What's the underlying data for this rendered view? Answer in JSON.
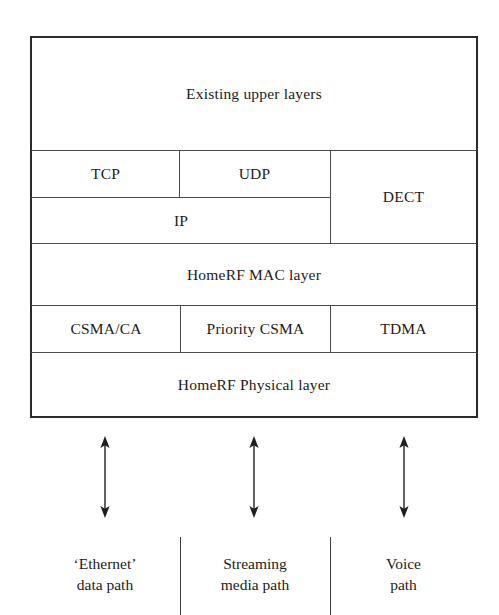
{
  "diagram": {
    "type": "layered-block-diagram",
    "ink_color": "#2b2b2b",
    "rule_color": "#4a4a4a",
    "background_color": "#ffffff"
  },
  "stack": {
    "rows": [
      {
        "id": "upper-layers",
        "cells": [
          {
            "id": "existing-upper-layers",
            "label": "Existing upper layers"
          }
        ]
      },
      {
        "id": "transport",
        "cells": [
          {
            "id": "tcp",
            "label": "TCP"
          },
          {
            "id": "udp",
            "label": "UDP"
          },
          {
            "id": "dect",
            "label": "DECT"
          }
        ]
      },
      {
        "id": "network",
        "cells": [
          {
            "id": "ip",
            "label": "IP"
          }
        ]
      },
      {
        "id": "mac",
        "cells": [
          {
            "id": "homerf-mac-layer",
            "label": "HomeRF MAC layer"
          }
        ]
      },
      {
        "id": "access-methods",
        "cells": [
          {
            "id": "csma-ca",
            "label": "CSMA/CA"
          },
          {
            "id": "priority-csma",
            "label": "Priority CSMA"
          },
          {
            "id": "tdma",
            "label": "TDMA"
          }
        ]
      },
      {
        "id": "physical",
        "cells": [
          {
            "id": "homerf-physical-layer",
            "label": "HomeRF Physical layer"
          }
        ]
      }
    ]
  },
  "connectors": [
    {
      "id": "data-path-arrow",
      "kind": "double-headed-vertical-arrow"
    },
    {
      "id": "media-path-arrow",
      "kind": "double-headed-vertical-arrow"
    },
    {
      "id": "voice-path-arrow",
      "kind": "double-headed-vertical-arrow"
    }
  ],
  "paths": [
    {
      "id": "ethernet-data-path",
      "line1": "‘Ethernet’",
      "line2": "data path"
    },
    {
      "id": "streaming-media-path",
      "line1": "Streaming",
      "line2": "media path"
    },
    {
      "id": "voice-path",
      "line1": "Voice",
      "line2": "path"
    }
  ]
}
